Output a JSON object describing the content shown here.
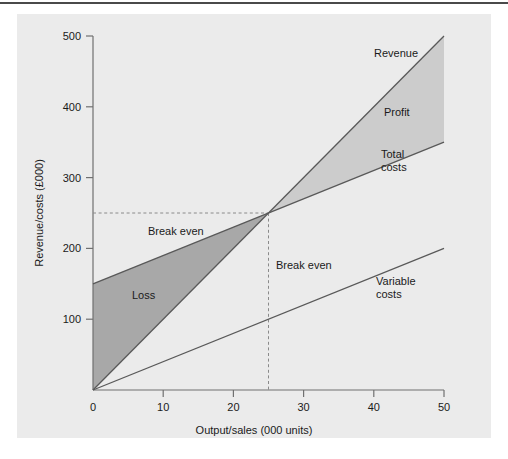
{
  "figure": {
    "background": "#ffffff",
    "panel_color": "#ebebeb",
    "rule_color": "#4a4a4a"
  },
  "chart_data": {
    "type": "line",
    "title": "",
    "xlabel": "Output/sales (000 units)",
    "ylabel": "Revenue/costs (£000)",
    "xlim": [
      0,
      50
    ],
    "ylim": [
      0,
      500
    ],
    "xticks": [
      0,
      10,
      20,
      30,
      40,
      50
    ],
    "yticks": [
      100,
      200,
      300,
      400,
      500
    ],
    "xtick_labels": [
      "0",
      "10",
      "20",
      "30",
      "40",
      "50"
    ],
    "ytick_labels": [
      "100",
      "200",
      "300",
      "400",
      "500"
    ],
    "grid": false,
    "legend_position": "inline-labels",
    "series": [
      {
        "name": "Revenue",
        "label": "Revenue",
        "color": "#595959",
        "x": [
          0,
          50
        ],
        "values": [
          0,
          500
        ]
      },
      {
        "name": "Total costs",
        "label": "Total costs",
        "label_line1": "Total",
        "label_line2": "costs",
        "color": "#595959",
        "x": [
          0,
          50
        ],
        "values": [
          150,
          350
        ]
      },
      {
        "name": "Variable costs",
        "label": "Variable costs",
        "label_line1": "Variable",
        "label_line2": "costs",
        "color": "#595959",
        "x": [
          0,
          50
        ],
        "values": [
          0,
          200
        ]
      }
    ],
    "regions": [
      {
        "name": "Loss",
        "label": "Loss",
        "color": "#a8a8a8",
        "description": "Area between total costs and revenue below break-even point",
        "vertices": [
          [
            0,
            0
          ],
          [
            0,
            150
          ],
          [
            25,
            250
          ]
        ]
      },
      {
        "name": "Profit",
        "label": "Profit",
        "color": "#cccccc",
        "description": "Area between revenue and total costs above break-even point",
        "vertices": [
          [
            25,
            250
          ],
          [
            50,
            500
          ],
          [
            50,
            350
          ]
        ]
      }
    ],
    "annotations": [
      {
        "name": "break-even-horizontal",
        "label": "Break even",
        "value": 250,
        "axis": "y",
        "style": "dashed",
        "color": "#8a8a8a"
      },
      {
        "name": "break-even-vertical",
        "label": "Break even",
        "value": 25,
        "axis": "x",
        "style": "dashed",
        "color": "#8a8a8a"
      }
    ],
    "break_even": {
      "x": 25,
      "y": 250,
      "label": "Break even"
    }
  }
}
